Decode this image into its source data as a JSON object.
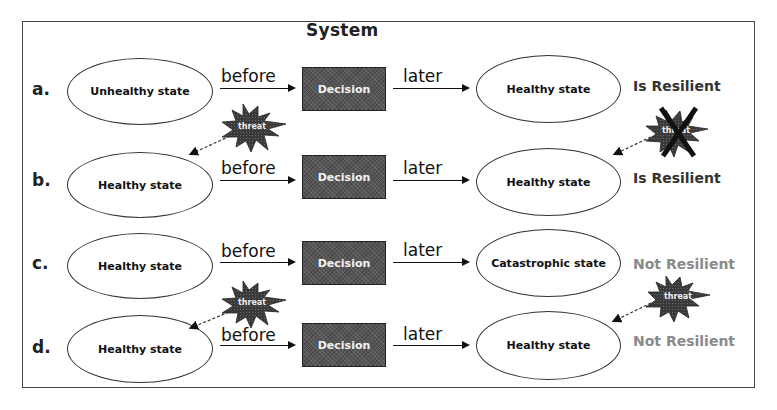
{
  "figure": {
    "frame_title": "System"
  },
  "labels": {
    "before": "before",
    "later": "later",
    "decision": "Decision",
    "threat": "threat"
  },
  "colors": {
    "resilient": "#333333",
    "not_resilient": "#8a8a8a",
    "decision_fill": "#555555",
    "threat_fill": "#3a3a3a"
  },
  "rows": [
    {
      "id": "a",
      "label": "a.",
      "initial_state": "Unhealthy state",
      "final_state": "Healthy state",
      "result": "Is Resilient",
      "threat_before": false,
      "threat_after": true,
      "threat_after_blocked": true
    },
    {
      "id": "b",
      "label": "b.",
      "initial_state": "Healthy state",
      "final_state": "Healthy state",
      "result": "Is Resilient",
      "threat_before": true,
      "threat_after": false,
      "threat_after_blocked": false
    },
    {
      "id": "c",
      "label": "c.",
      "initial_state": "Healthy state",
      "final_state": "Catastrophic state",
      "result": "Not Resilient",
      "threat_before": false,
      "threat_after": true,
      "threat_after_blocked": false
    },
    {
      "id": "d",
      "label": "d.",
      "initial_state": "Healthy state",
      "final_state": "Healthy state",
      "result": "Not Resilient",
      "threat_before": true,
      "threat_after": false,
      "threat_after_blocked": false
    }
  ]
}
